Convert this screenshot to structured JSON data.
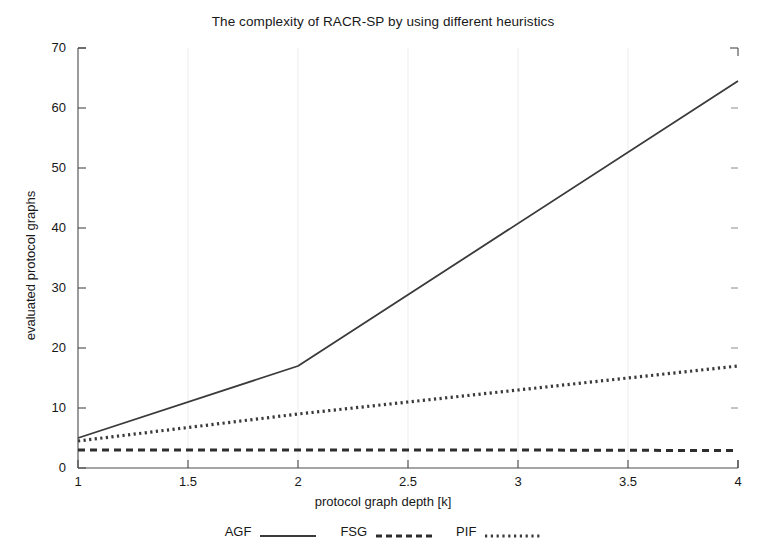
{
  "chart_data": {
    "type": "line",
    "title": "The complexity of RACR-SP by using different heuristics",
    "xlabel": "protocol graph depth [k]",
    "ylabel": "evaluated protocol graphs",
    "xlim": [
      1,
      4
    ],
    "ylim": [
      0,
      70
    ],
    "xticks": [
      1,
      1.5,
      2,
      2.5,
      3,
      3.5,
      4
    ],
    "xticklabels": [
      "1",
      "1.5",
      "2",
      "2.5",
      "3",
      "3.5",
      "4"
    ],
    "yticks": [
      0,
      10,
      20,
      30,
      40,
      50,
      60,
      70
    ],
    "yticklabels": [
      "0",
      "10",
      "20",
      "30",
      "40",
      "50",
      "60",
      "70"
    ],
    "grid": "vertical-faint",
    "legend_position": "below-axes",
    "series": [
      {
        "name": "AGF",
        "style": "solid",
        "color": "#3a3a3a",
        "x": [
          1,
          2,
          4
        ],
        "y": [
          5,
          17,
          64.5
        ]
      },
      {
        "name": "FSG",
        "style": "dashed",
        "color": "#2e2e2e",
        "x": [
          1,
          2,
          3,
          4
        ],
        "y": [
          3,
          3,
          3,
          2.9
        ]
      },
      {
        "name": "PIF",
        "style": "dotted",
        "color": "#3a3a3a",
        "x": [
          1,
          2,
          2.5,
          3,
          4
        ],
        "y": [
          4.5,
          9,
          11,
          13,
          17
        ]
      }
    ]
  },
  "legend": {
    "entries": [
      {
        "label": "AGF",
        "swatch": "solid-line-swatch"
      },
      {
        "label": "FSG",
        "swatch": "dashed-line-swatch"
      },
      {
        "label": "PIF",
        "swatch": "dotted-line-swatch"
      }
    ]
  },
  "axes": {
    "y_tick_labels": [
      "70",
      "60",
      "50",
      "40",
      "30",
      "20",
      "10",
      "0"
    ],
    "x_tick_labels": [
      "1",
      "1.5",
      "2",
      "2.5",
      "3",
      "3.5",
      "4"
    ]
  }
}
